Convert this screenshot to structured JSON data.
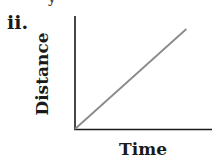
{
  "panel": {
    "label": "ii.",
    "top_fragment": "y"
  },
  "chart_data": {
    "type": "line",
    "title": "",
    "xlabel": "Time",
    "ylabel": "Distance",
    "x": [
      0,
      1
    ],
    "series": [
      {
        "name": "distance-vs-time",
        "values": [
          0,
          1
        ],
        "color": "#8a8a8a"
      }
    ],
    "xlim": [
      0,
      1.23
    ],
    "ylim": [
      0,
      1.13
    ],
    "grid": false,
    "legend": null,
    "ticks": false
  },
  "colors": {
    "axis": "#1a1a1a",
    "line": "#8a8a8a",
    "background": "#ffffff"
  }
}
